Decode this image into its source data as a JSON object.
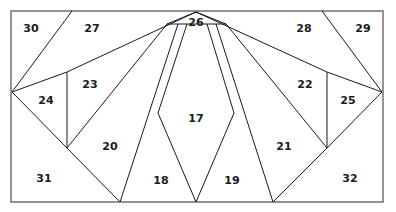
{
  "figure": {
    "type": "geometric-partition-diagram",
    "canvas": {
      "width": 396,
      "height": 212,
      "background": "#ffffff"
    },
    "border": {
      "name": "outer-rectangle",
      "x": 11,
      "y": 11,
      "width": 372,
      "height": 191,
      "stroke": "#787878",
      "fill": "#ffffff",
      "stroke_width": 1.6
    },
    "style": {
      "line_color": "#1a1a1a",
      "line_width": 1,
      "label_color": "#1a1a1a",
      "label_size": 11
    },
    "points": {
      "top_left": [
        11,
        11
      ],
      "top_right": [
        383,
        11
      ],
      "bottom_left": [
        11,
        202
      ],
      "bottom_right": [
        383,
        202
      ],
      "apex": [
        196,
        12
      ],
      "apex_band_left": [
        167,
        24
      ],
      "apex_band_right": [
        226,
        24
      ],
      "left_hub": [
        12,
        92
      ],
      "right_hub": [
        382,
        92
      ],
      "left_knee": [
        67,
        148
      ],
      "right_knee": [
        327,
        148
      ],
      "left_post_top": [
        67,
        72
      ],
      "right_post_top": [
        327,
        72
      ],
      "top_edge_left": [
        72,
        11
      ],
      "top_edge_right": [
        322,
        11
      ],
      "bottom_v1": [
        120,
        202
      ],
      "bottom_v2": [
        196,
        202
      ],
      "bottom_v3": [
        273,
        202
      ],
      "notch_left": [
        158,
        113
      ],
      "notch_right": [
        234,
        113
      ]
    },
    "segments": [
      {
        "name": "segment-topleft-diagonal",
        "from": [
          12,
          92
        ],
        "to": [
          72,
          11
        ]
      },
      {
        "name": "segment-topright-diagonal",
        "from": [
          382,
          92
        ],
        "to": [
          322,
          11
        ]
      },
      {
        "name": "segment-apex-to-left-post",
        "from": [
          196,
          12
        ],
        "to": [
          67,
          72
        ]
      },
      {
        "name": "segment-apex-to-right-post",
        "from": [
          196,
          12
        ],
        "to": [
          327,
          72
        ]
      },
      {
        "name": "segment-left-hub-to-post-top",
        "from": [
          12,
          92
        ],
        "to": [
          67,
          72
        ]
      },
      {
        "name": "segment-right-hub-to-post-top",
        "from": [
          382,
          92
        ],
        "to": [
          327,
          72
        ]
      },
      {
        "name": "segment-left-vertical-post",
        "from": [
          67,
          72
        ],
        "to": [
          67,
          148
        ]
      },
      {
        "name": "segment-right-vertical-post",
        "from": [
          327,
          72
        ],
        "to": [
          327,
          148
        ]
      },
      {
        "name": "segment-left-hub-to-knee",
        "from": [
          12,
          92
        ],
        "to": [
          67,
          148
        ]
      },
      {
        "name": "segment-right-hub-to-knee",
        "from": [
          382,
          92
        ],
        "to": [
          327,
          148
        ]
      },
      {
        "name": "segment-knee-left-to-bottom",
        "from": [
          67,
          148
        ],
        "to": [
          120,
          202
        ]
      },
      {
        "name": "segment-knee-right-to-bottom",
        "from": [
          327,
          148
        ],
        "to": [
          273,
          202
        ]
      },
      {
        "name": "segment-band-left",
        "from": [
          196,
          12
        ],
        "to": [
          167,
          24
        ]
      },
      {
        "name": "segment-band-right",
        "from": [
          196,
          12
        ],
        "to": [
          226,
          24
        ]
      },
      {
        "name": "segment-band-horizontal",
        "from": [
          167,
          24
        ],
        "to": [
          226,
          24
        ]
      },
      {
        "name": "segment-fan-to-knee",
        "from": [
          167,
          24
        ],
        "to": [
          67,
          148
        ]
      },
      {
        "name": "segment-fan-to-bottom-v1",
        "from": [
          178,
          24
        ],
        "to": [
          120,
          202
        ]
      },
      {
        "name": "segment-fan-to-notch-left",
        "from": [
          187,
          24
        ],
        "to": [
          158,
          113
        ]
      },
      {
        "name": "segment-notch-left-to-bottom",
        "from": [
          158,
          113
        ],
        "to": [
          196,
          202
        ]
      },
      {
        "name": "segment-fan-to-notch-right",
        "from": [
          207,
          24
        ],
        "to": [
          234,
          113
        ]
      },
      {
        "name": "segment-notch-right-to-bottom",
        "from": [
          234,
          113
        ],
        "to": [
          196,
          202
        ]
      },
      {
        "name": "segment-fan-to-bottom-v3",
        "from": [
          216,
          24
        ],
        "to": [
          273,
          202
        ]
      },
      {
        "name": "segment-fan-to-right-knee",
        "from": [
          226,
          24
        ],
        "to": [
          327,
          148
        ]
      }
    ],
    "regions": [
      {
        "id": "17",
        "label": "17",
        "x": 196,
        "y": 119
      },
      {
        "id": "18",
        "label": "18",
        "x": 161,
        "y": 181
      },
      {
        "id": "19",
        "label": "19",
        "x": 232,
        "y": 181
      },
      {
        "id": "20",
        "label": "20",
        "x": 110,
        "y": 147
      },
      {
        "id": "21",
        "label": "21",
        "x": 284,
        "y": 147
      },
      {
        "id": "22",
        "label": "22",
        "x": 305,
        "y": 85
      },
      {
        "id": "23",
        "label": "23",
        "x": 90,
        "y": 85
      },
      {
        "id": "24",
        "label": "24",
        "x": 46,
        "y": 101
      },
      {
        "id": "25",
        "label": "25",
        "x": 348,
        "y": 101
      },
      {
        "id": "26",
        "label": "26",
        "x": 196,
        "y": 23
      },
      {
        "id": "27",
        "label": "27",
        "x": 92,
        "y": 29
      },
      {
        "id": "28",
        "label": "28",
        "x": 304,
        "y": 29
      },
      {
        "id": "29",
        "label": "29",
        "x": 363,
        "y": 29
      },
      {
        "id": "30",
        "label": "30",
        "x": 31,
        "y": 29
      },
      {
        "id": "31",
        "label": "31",
        "x": 44,
        "y": 179
      },
      {
        "id": "32",
        "label": "32",
        "x": 350,
        "y": 179
      }
    ]
  }
}
